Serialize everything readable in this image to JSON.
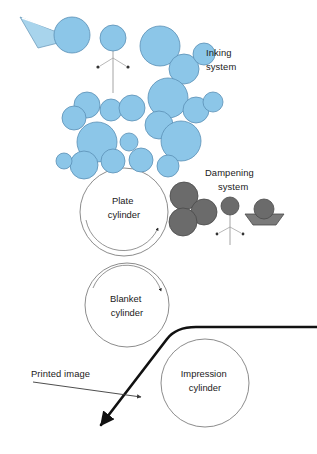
{
  "diagram": {
    "background_color": "#ffffff",
    "width": 317,
    "height": 454,
    "colors": {
      "ink_roller_fill": "#8CC6E8",
      "ink_roller_stroke": "#5A8FB5",
      "ink_fountain_fill": "#A8D4EC",
      "damp_roller_fill": "#6B6B6B",
      "damp_roller_stroke": "#4A4A4A",
      "cylinder_stroke": "#6E6E6E",
      "paper_web_stroke": "#111111",
      "text_color": "#1a1a1a"
    },
    "labels": [
      {
        "id": "inking-system",
        "line1": "Inking",
        "line2": "system",
        "x": 206,
        "y": 56
      },
      {
        "id": "dampening-system",
        "line1": "Dampening",
        "line2": "system",
        "x": 205,
        "y": 176
      },
      {
        "id": "plate-cylinder",
        "line1": "Plate",
        "line2": "cylinder",
        "x": 124,
        "y": 204
      },
      {
        "id": "blanket-cylinder",
        "line1": "Blanket",
        "line2": "cylinder",
        "x": 127,
        "y": 302
      },
      {
        "id": "impression-cylinder",
        "line1": "Impression",
        "line2": "cylinder",
        "x": 205,
        "y": 377
      },
      {
        "id": "printed-image",
        "line1": "Printed image",
        "line2": "",
        "x": 31,
        "y": 380
      }
    ],
    "cylinders": [
      {
        "id": "plate-cylinder",
        "name": "Plate cylinder",
        "cx": 124,
        "cy": 212,
        "r": 44,
        "rotation": "clockwise"
      },
      {
        "id": "blanket-cylinder",
        "name": "Blanket cylinder",
        "cx": 127,
        "cy": 305,
        "r": 42,
        "rotation": "clockwise"
      },
      {
        "id": "impression-cylinder",
        "name": "Impression cylinder",
        "cx": 205,
        "cy": 383,
        "r": 44,
        "rotation": "none"
      }
    ],
    "ink_fountain": {
      "id": "ink-fountain",
      "name": "Ink fountain",
      "points": "20,17 74,39 38,48",
      "blade_line": "22,18 70,35"
    },
    "ink_rollers": [
      {
        "id": "fountain-roller",
        "cx": 72,
        "cy": 35,
        "r": 18
      },
      {
        "id": "ductor-roller",
        "cx": 113,
        "cy": 38,
        "r": 13
      },
      {
        "id": "ink-roller-3",
        "cx": 160,
        "cy": 46,
        "r": 20
      },
      {
        "id": "ink-roller-4",
        "cx": 184,
        "cy": 69,
        "r": 15
      },
      {
        "id": "ink-roller-5",
        "cx": 204,
        "cy": 54,
        "r": 11
      },
      {
        "id": "ink-roller-6",
        "cx": 87,
        "cy": 105,
        "r": 13
      },
      {
        "id": "ink-roller-7",
        "cx": 111,
        "cy": 110,
        "r": 11
      },
      {
        "id": "ink-roller-8",
        "cx": 132,
        "cy": 108,
        "r": 13
      },
      {
        "id": "ink-roller-9",
        "cx": 74,
        "cy": 118,
        "r": 12
      },
      {
        "id": "ink-roller-10",
        "cx": 168,
        "cy": 98,
        "r": 20
      },
      {
        "id": "ink-roller-11",
        "cx": 196,
        "cy": 110,
        "r": 13
      },
      {
        "id": "ink-roller-12",
        "cx": 213,
        "cy": 102,
        "r": 10
      },
      {
        "id": "ink-roller-13",
        "cx": 159,
        "cy": 125,
        "r": 14
      },
      {
        "id": "ink-roller-14",
        "cx": 97,
        "cy": 142,
        "r": 20
      },
      {
        "id": "ink-roller-15",
        "cx": 129,
        "cy": 142,
        "r": 9
      },
      {
        "id": "ink-roller-16",
        "cx": 181,
        "cy": 141,
        "r": 20
      },
      {
        "id": "ink-roller-17",
        "cx": 113,
        "cy": 161,
        "r": 12
      },
      {
        "id": "ink-roller-18",
        "cx": 141,
        "cy": 160,
        "r": 12
      },
      {
        "id": "ink-roller-19",
        "cx": 84,
        "cy": 165,
        "r": 14
      },
      {
        "id": "ink-roller-20",
        "cx": 64,
        "cy": 161,
        "r": 8
      },
      {
        "id": "ink-roller-21",
        "cx": 168,
        "cy": 166,
        "r": 11
      }
    ],
    "dampening_rollers": [
      {
        "id": "damp-roller-1",
        "cx": 184,
        "cy": 196,
        "r": 14
      },
      {
        "id": "damp-roller-2",
        "cx": 204,
        "cy": 212,
        "r": 13
      },
      {
        "id": "damp-roller-3",
        "cx": 183,
        "cy": 222,
        "r": 14
      },
      {
        "id": "damp-ductor-roller",
        "cx": 230,
        "cy": 206,
        "r": 9
      },
      {
        "id": "damp-fountain-roller",
        "cx": 264,
        "cy": 209,
        "r": 10
      }
    ],
    "water_pan": {
      "id": "water-pan",
      "name": "Water fountain pan",
      "points": "246,214 282,214 275,224 253,224"
    },
    "oscillator_ink": {
      "id": "ink-oscillator-mechanism",
      "stem": "113,38 113,93",
      "left_arm": "113,58 99,66",
      "right_arm": "113,58 127,66",
      "left_dot": {
        "cx": 98,
        "cy": 67,
        "r": 1.6
      },
      "right_dot": {
        "cx": 128,
        "cy": 67,
        "r": 1.6
      }
    },
    "oscillator_damp": {
      "id": "damp-oscillator-mechanism",
      "stem": "230,206 230,244",
      "left_arm": "230,226 218,233",
      "right_arm": "230,226 242,233",
      "left_dot": {
        "cx": 217,
        "cy": 234,
        "r": 1.4
      },
      "right_dot": {
        "cx": 243,
        "cy": 234,
        "r": 1.4
      }
    },
    "paper_web": {
      "id": "paper-web",
      "name": "Paper web / printed sheet",
      "path": "M 317,327 L 195,327 Q 176,327 168,338 L 98,428"
    },
    "printed_image_arrow": {
      "id": "printed-image-arrow",
      "line": "M 67,384 L 141,397"
    },
    "rotation_arrows": [
      {
        "id": "plate-rotation-arrow",
        "cylinder": "plate-cylinder"
      },
      {
        "id": "blanket-rotation-arrow",
        "cylinder": "blanket-cylinder"
      }
    ]
  }
}
